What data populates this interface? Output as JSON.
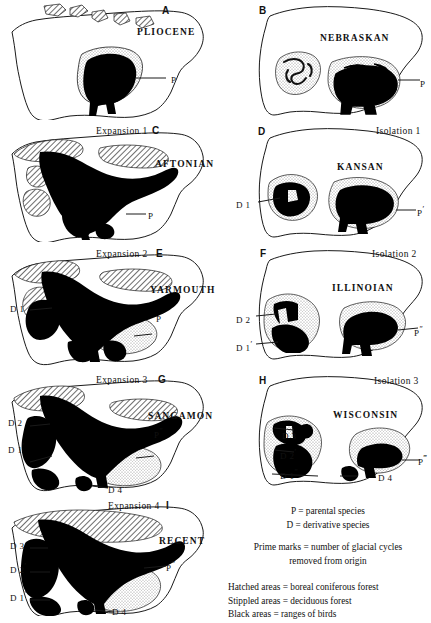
{
  "panels": [
    {
      "id": "A",
      "letter": "A",
      "phase": "",
      "era": "PLIOCENE",
      "species": [
        {
          "base": "P",
          "primes": ""
        }
      ]
    },
    {
      "id": "B",
      "letter": "B",
      "phase": "",
      "era": "NEBRASKAN",
      "species": [
        {
          "base": "P",
          "primes": ""
        }
      ]
    },
    {
      "id": "C",
      "letter": "C",
      "phase": "Expansion 1",
      "era": "AFTONIAN",
      "species": [
        {
          "base": "P",
          "primes": ""
        }
      ]
    },
    {
      "id": "D",
      "letter": "D",
      "phase": "Isolation 1",
      "era": "KANSAN",
      "species": [
        {
          "base": "D 1",
          "primes": ""
        },
        {
          "base": "P",
          "primes": "′"
        }
      ]
    },
    {
      "id": "E",
      "letter": "E",
      "phase": "Expansion 2",
      "era": "YARMOUTH",
      "species": [
        {
          "base": "D 1",
          "primes": ""
        },
        {
          "base": "P",
          "primes": "′"
        }
      ]
    },
    {
      "id": "F",
      "letter": "F",
      "phase": "Isolation 2",
      "era": "ILLINOIAN",
      "species": [
        {
          "base": "D 2",
          "primes": ""
        },
        {
          "base": "D 1",
          "primes": "′"
        },
        {
          "base": "P",
          "primes": "″"
        }
      ]
    },
    {
      "id": "G",
      "letter": "G",
      "phase": "Expansion 3",
      "era": "SANGAMON",
      "species": [
        {
          "base": "D 2",
          "primes": ""
        },
        {
          "base": "D 1",
          "primes": "′"
        },
        {
          "base": "P",
          "primes": "″"
        },
        {
          "base": "D 4",
          "primes": ""
        }
      ]
    },
    {
      "id": "H",
      "letter": "H",
      "phase": "Isolation 3",
      "era": "WISCONSIN",
      "species": [
        {
          "base": "D 3",
          "primes": ""
        },
        {
          "base": "D 2",
          "primes": "′"
        },
        {
          "base": "D 1",
          "primes": "″"
        },
        {
          "base": "D 4",
          "primes": ""
        },
        {
          "base": "P",
          "primes": "‴"
        }
      ]
    },
    {
      "id": "I",
      "letter": "I",
      "phase": "Expansion 4",
      "era": "RECENT",
      "species": [
        {
          "base": "D 3",
          "primes": ""
        },
        {
          "base": "D 2",
          "primes": "′"
        },
        {
          "base": "D 1",
          "primes": "″"
        },
        {
          "base": "P",
          "primes": "‴"
        },
        {
          "base": "D 4",
          "primes": ""
        }
      ]
    }
  ],
  "legend": {
    "parental": "P  =  parental species",
    "derivative": "D  =  derivative species",
    "prime_line1": "Prime marks  =  number of glacial cycles",
    "prime_line2": "removed from origin",
    "hatched": "Hatched areas  =  boreal coniferous forest",
    "stippled": "Stippled areas  =  deciduous forest",
    "black": "Black areas  =  ranges of birds"
  },
  "colors": {
    "outline": "#1a1a1a",
    "black_range": "#000000",
    "hatch": "#4a4a4a",
    "stipple": "#9a9a9a",
    "background": "#ffffff"
  }
}
